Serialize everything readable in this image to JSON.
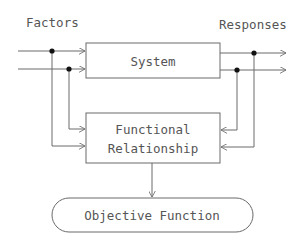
{
  "diagram": {
    "title_left": "Factors",
    "title_right": "Responses",
    "system_box": {
      "label": "System"
    },
    "functional_box": {
      "line1": "Functional",
      "line2": "Relationship"
    },
    "objective": {
      "label": "Objective Function"
    },
    "colors": {
      "stroke": "#6a6a6a",
      "text": "#555555",
      "dot": "#111111",
      "background": "#ffffff"
    }
  }
}
